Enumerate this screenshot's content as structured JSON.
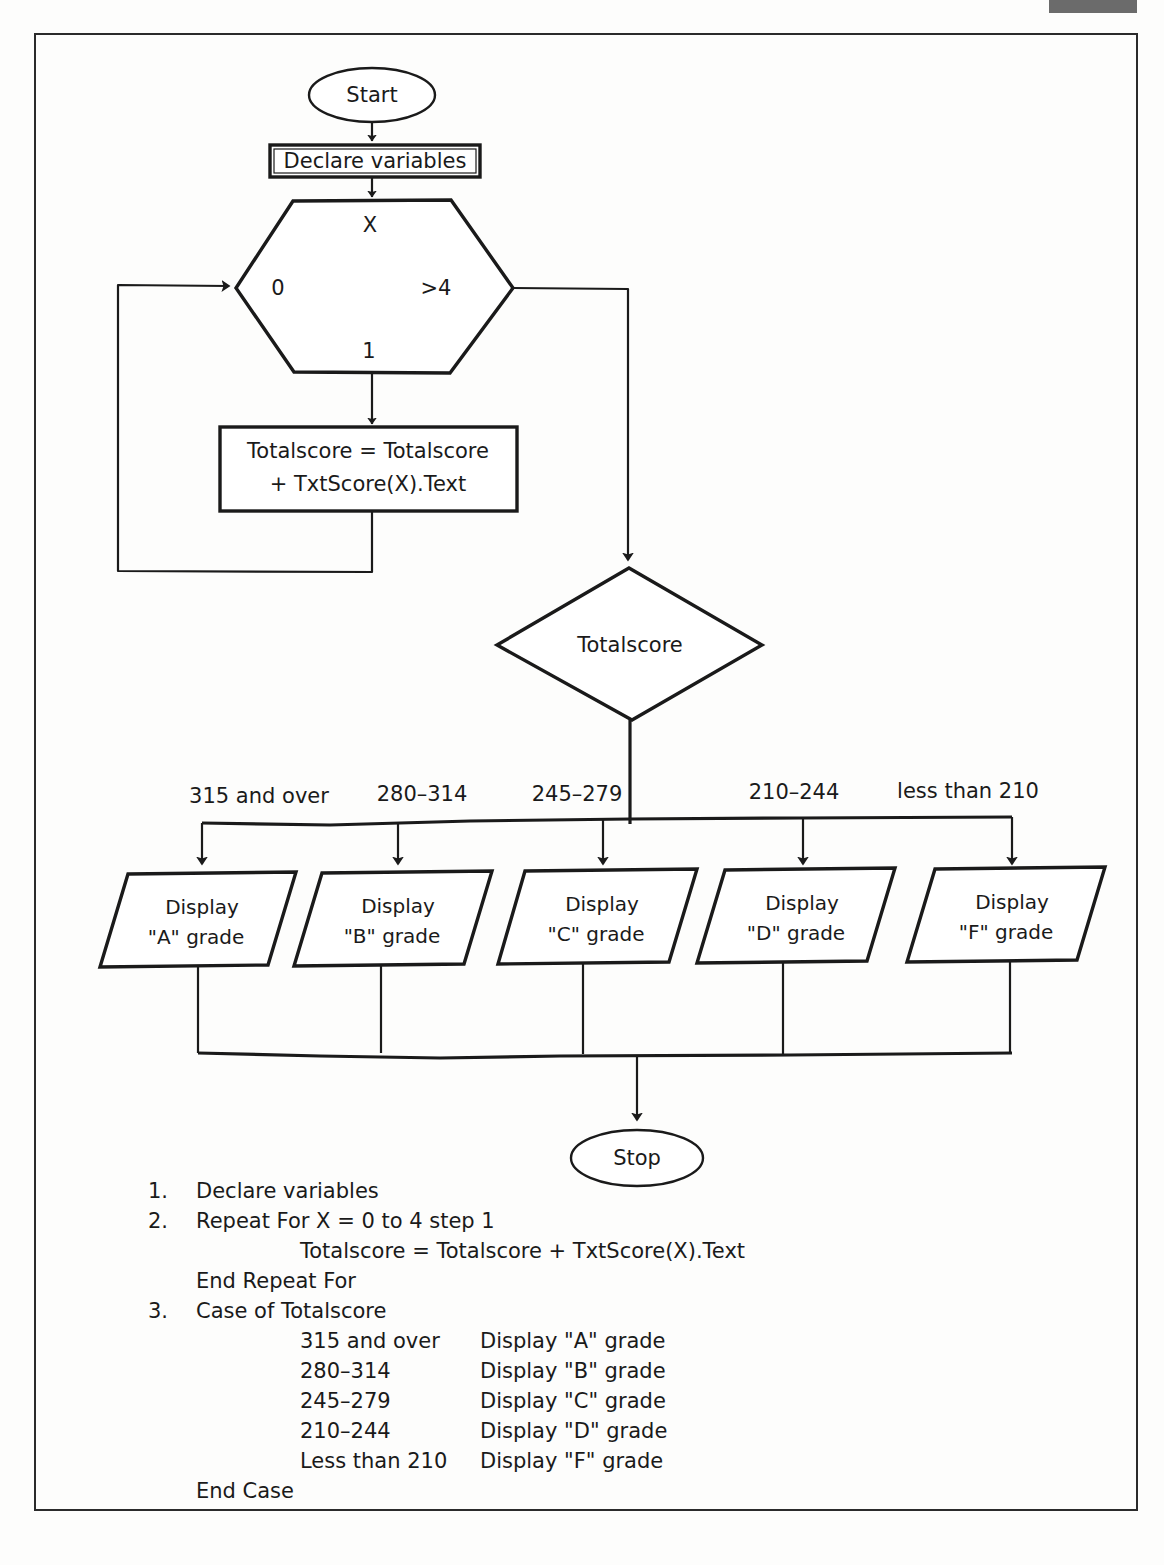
{
  "page": {
    "border_color": "#2b2b2b",
    "gray_bar_color": "#6b6b6b",
    "ink_color": "#1a1a1a",
    "background_color": "#ffffff"
  },
  "flowchart": {
    "start_label": "Start",
    "stop_label": "Stop",
    "declare_label": "Declare variables",
    "loop": {
      "variable_label": "X",
      "from_label": "0",
      "to_label": ">4",
      "step_label": "1"
    },
    "process_line1": "Totalscore = Totalscore",
    "process_line2": "+ TxtScore(X).Text",
    "decision_label": "Totalscore",
    "branches": [
      {
        "condition": "315 and over",
        "action_line1": "Display",
        "action_line2": "\"A\" grade"
      },
      {
        "condition": "280–314",
        "action_line1": "Display",
        "action_line2": "\"B\" grade"
      },
      {
        "condition": "245–279",
        "action_line1": "Display",
        "action_line2": "\"C\" grade"
      },
      {
        "condition": "210–244",
        "action_line1": "Display",
        "action_line2": "\"D\" grade"
      },
      {
        "condition": "less than 210",
        "action_line1": "Display",
        "action_line2": "\"F\" grade"
      }
    ]
  },
  "pseudocode": {
    "step1_num": "1.",
    "step1_text": "Declare variables",
    "step2_num": "2.",
    "step2_text": "Repeat For X = 0 to 4 step 1",
    "step2_body": "Totalscore = Totalscore + TxtScore(X).Text",
    "end_repeat": "End Repeat For",
    "step3_num": "3.",
    "step3_text": "Case of Totalscore",
    "cases": [
      {
        "condition": "315 and over",
        "action": "Display \"A\" grade"
      },
      {
        "condition": "280–314",
        "action": "Display \"B\" grade"
      },
      {
        "condition": "245–279",
        "action": "Display \"C\" grade"
      },
      {
        "condition": "210–244",
        "action": "Display \"D\" grade"
      },
      {
        "condition": "Less than 210",
        "action": "Display \"F\" grade"
      }
    ],
    "end_case": "End Case"
  }
}
